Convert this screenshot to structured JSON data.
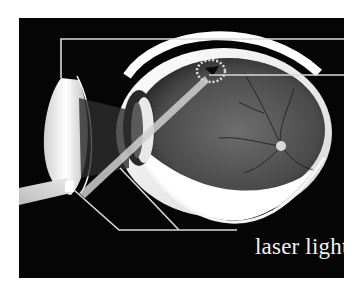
{
  "figure": {
    "background_color": "#050505",
    "callout_color": "#d9d9d9",
    "labels": {
      "laser": "laser light"
    },
    "callouts": [
      {
        "target": "cornea/lens",
        "side": "right-top",
        "text": ""
      },
      {
        "target": "treated retina spot",
        "side": "right-middle",
        "text": ""
      },
      {
        "target": "laser beam",
        "side": "bottom",
        "text": "laser light"
      }
    ]
  }
}
